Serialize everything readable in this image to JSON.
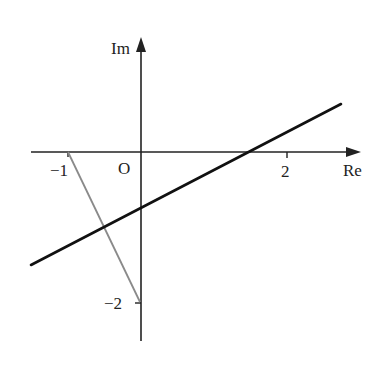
{
  "diagram": {
    "axes": {
      "x_label": "Re",
      "y_label": "Im",
      "origin_label": "O",
      "x_ticks": [
        {
          "value": -1,
          "label": "−1"
        },
        {
          "value": 2,
          "label": "2"
        }
      ],
      "y_ticks": [
        {
          "value": -2,
          "label": "−2"
        }
      ]
    },
    "segment": {
      "from": [
        -1,
        0
      ],
      "to": [
        0,
        -2
      ],
      "color": "#888888"
    },
    "line": {
      "equation": "y = 0.5x - 0.75",
      "slope": 0.5,
      "intercept": -0.75,
      "x_range": [
        -1.5,
        2.75
      ],
      "color": "#111111"
    },
    "colors": {
      "axis": "#222222",
      "line": "#111111",
      "segment": "#888888"
    }
  }
}
